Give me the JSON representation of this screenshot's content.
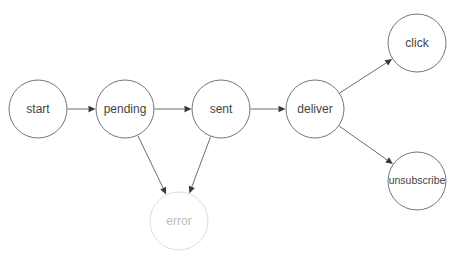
{
  "diagram": {
    "type": "state-diagram",
    "canvas": {
      "width": 454,
      "height": 260,
      "background": "#ffffff"
    },
    "style": {
      "node_stroke": "#757575",
      "node_fill": "#ffffff",
      "node_stroke_faded": "#dcdcdc",
      "label_color": "#444444",
      "label_color_faded": "#bdbdbd",
      "edge_color": "#6e6e6e",
      "arrowhead_color": "#3a3a3a",
      "node_radius": 29
    },
    "nodes": [
      {
        "id": "start",
        "label": "start",
        "cx": 38,
        "cy": 109,
        "r": 29,
        "state": "normal"
      },
      {
        "id": "pending",
        "label": "pending",
        "cx": 125,
        "cy": 109,
        "r": 29,
        "state": "normal"
      },
      {
        "id": "sent",
        "label": "sent",
        "cx": 221,
        "cy": 109,
        "r": 29,
        "state": "normal"
      },
      {
        "id": "deliver",
        "label": "deliver",
        "cx": 315,
        "cy": 109,
        "r": 29,
        "state": "normal"
      },
      {
        "id": "click",
        "label": "click",
        "cx": 417,
        "cy": 43,
        "r": 29,
        "state": "normal"
      },
      {
        "id": "unsubscribe",
        "label": "unsubscribe",
        "cx": 417,
        "cy": 181,
        "r": 29,
        "state": "normal"
      },
      {
        "id": "error",
        "label": "error",
        "cx": 179,
        "cy": 221,
        "r": 29,
        "state": "faded"
      }
    ],
    "edges": [
      {
        "id": "start-pending",
        "from": "start",
        "to": "pending",
        "label": ""
      },
      {
        "id": "pending-sent",
        "from": "pending",
        "to": "sent",
        "label": ""
      },
      {
        "id": "sent-deliver",
        "from": "sent",
        "to": "deliver",
        "label": ""
      },
      {
        "id": "deliver-click",
        "from": "deliver",
        "to": "click",
        "label": ""
      },
      {
        "id": "deliver-unsubscribe",
        "from": "deliver",
        "to": "unsubscribe",
        "label": ""
      },
      {
        "id": "pending-error",
        "from": "pending",
        "to": "error",
        "label": ""
      },
      {
        "id": "sent-error",
        "from": "sent",
        "to": "error",
        "label": ""
      }
    ]
  }
}
